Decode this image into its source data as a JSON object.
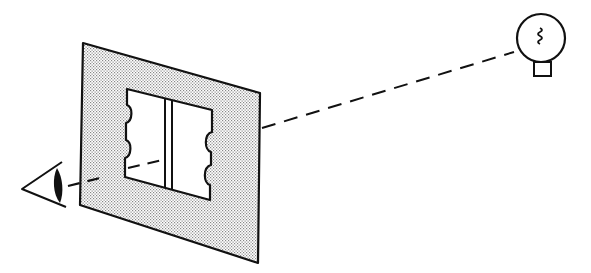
{
  "diagram": {
    "type": "optics-illustration",
    "description": "Eye viewing a light source through a double-slit screen",
    "colors": {
      "ink": "#111111",
      "screen_fill": "#d9d9d9",
      "background": "#ffffff",
      "aperture": "#ffffff"
    },
    "elements": {
      "eye": {
        "icon": "eye-icon",
        "position": [
          22,
          200
        ]
      },
      "screen": {
        "icon": "screen-panel",
        "corners": [
          [
            83,
            43
          ],
          [
            260,
            93
          ],
          [
            258,
            263
          ],
          [
            80,
            205
          ]
        ]
      },
      "aperture": {
        "corners": [
          [
            127,
            89
          ],
          [
            212,
            110
          ],
          [
            210,
            200
          ],
          [
            125,
            177
          ]
        ]
      },
      "slits": {
        "count": 2,
        "x": [
          165,
          172
        ]
      },
      "light_bulb": {
        "icon": "light-bulb-icon",
        "center": [
          540,
          40
        ],
        "radius": 24
      },
      "light_ray": {
        "style": "dashed",
        "from": [
          70,
          188
        ],
        "to": [
          514,
          52
        ]
      }
    },
    "labels": []
  }
}
